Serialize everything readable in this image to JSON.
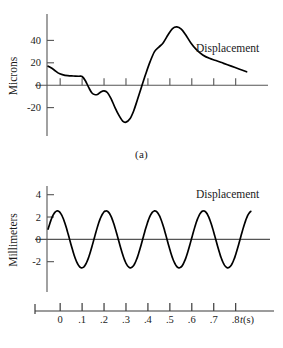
{
  "figure": {
    "title": "",
    "panels": [
      {
        "id": "a",
        "caption": "(a)",
        "series_label": "Displacement",
        "ylabel": "Microns",
        "yticks": [
          "40",
          "20",
          "0",
          "-20"
        ]
      },
      {
        "id": "b",
        "caption": "(b)",
        "series_label": "Displacement",
        "ylabel": "Millimeters",
        "yticks": [
          "4",
          "2",
          "0",
          "-2"
        ],
        "xlabel_italic": "t",
        "xlabel_unit": "(s)",
        "xticks": [
          "0",
          ".1",
          ".2",
          ".3",
          ".4",
          ".5",
          ".6",
          ".7",
          ".8"
        ]
      }
    ]
  },
  "chart_data": [
    {
      "type": "line",
      "panel": "a",
      "title": "",
      "subtitle": "",
      "xlabel": "",
      "ylabel": "Microns",
      "series_annotation": "Displacement",
      "caption": "(a)",
      "grid": false,
      "legend": "none",
      "xlim": [
        -0.06,
        0.92
      ],
      "ylim": [
        -40,
        60
      ],
      "ytick_values": [
        40,
        20,
        0,
        -20
      ],
      "ytick_labels": [
        "40",
        "20",
        "0",
        "-20"
      ],
      "xtick_values": [
        0.0,
        0.1,
        0.2,
        0.3,
        0.4,
        0.5,
        0.6,
        0.7,
        0.8
      ],
      "xtick_labels": [],
      "series": [
        {
          "name": "Displacement",
          "color": "#000000",
          "x": [
            -0.055,
            -0.03,
            -0.01,
            0.01,
            0.035,
            0.06,
            0.085,
            0.1,
            0.115,
            0.13,
            0.145,
            0.16,
            0.172,
            0.185,
            0.2,
            0.215,
            0.232,
            0.25,
            0.268,
            0.285,
            0.3,
            0.318,
            0.335,
            0.352,
            0.37,
            0.39,
            0.41,
            0.43,
            0.45,
            0.47,
            0.492,
            0.512,
            0.532,
            0.552,
            0.572,
            0.595,
            0.62,
            0.65,
            0.68,
            0.71,
            0.745,
            0.78,
            0.815,
            0.85
          ],
          "y": [
            17,
            14,
            11,
            9.5,
            8.5,
            8.2,
            8.0,
            7.8,
            4.0,
            -2.0,
            -7.0,
            -8.5,
            -8.0,
            -6.0,
            -5.0,
            -6.5,
            -12.0,
            -20.0,
            -27.0,
            -32.0,
            -33.0,
            -30.0,
            -23.0,
            -13.0,
            -2.0,
            10.0,
            21.0,
            30.0,
            34.0,
            38.0,
            45.0,
            50.5,
            52.0,
            50.0,
            45.0,
            38.0,
            32.0,
            27.0,
            24.0,
            22.0,
            19.5,
            17.0,
            14.5,
            12.0
          ]
        }
      ]
    },
    {
      "type": "line",
      "panel": "b",
      "title": "",
      "subtitle": "",
      "xlabel": "t(s)",
      "ylabel": "Millimeters",
      "series_annotation": "Displacement",
      "caption": "(b)",
      "grid": false,
      "legend": "none",
      "xlim": [
        -0.06,
        0.92
      ],
      "ylim": [
        -4,
        4.6
      ],
      "ytick_values": [
        4,
        2,
        0,
        -2
      ],
      "ytick_labels": [
        "4",
        "2",
        "0",
        "-2"
      ],
      "xtick_values": [
        0.0,
        0.1,
        0.2,
        0.3,
        0.4,
        0.5,
        0.6,
        0.7,
        0.8
      ],
      "xtick_labels": [
        "0",
        ".1",
        ".2",
        ".3",
        ".4",
        ".5",
        ".6",
        ".7",
        ".8"
      ],
      "waveform": {
        "form": "sinusoid",
        "amplitude": 2.55,
        "period": 0.222,
        "frequency": 4.5,
        "phase_at_x0": "descending-from-positive",
        "value_at_left_edge": 2.2
      },
      "series": [
        {
          "name": "Displacement",
          "color": "#000000",
          "description": "A(sin) with amplitude 2.55 mm and period 0.222 s spanning t = -0.055 to 0.87 s"
        }
      ]
    }
  ]
}
